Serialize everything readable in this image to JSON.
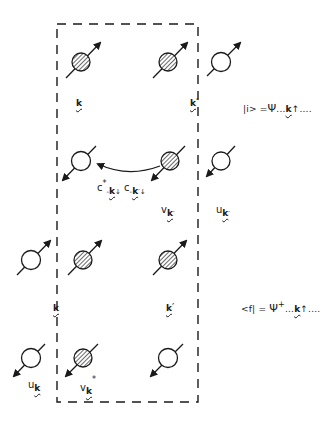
{
  "diagram": {
    "type": "pair-scattering-schematic",
    "box": {
      "style": "dashed",
      "x": 57,
      "y": 24,
      "width": 141,
      "height": 378,
      "stroke": "#1a1a1a"
    },
    "colors": {
      "ink": "#1a1a1a",
      "hatch": "#1a1a1a",
      "background": "#ffffff"
    },
    "rows": [
      {
        "name": "initial-up",
        "spins": [
          {
            "cx": 81,
            "cy": 62,
            "filled": true,
            "dir": "up"
          },
          {
            "cx": 168,
            "cy": 62,
            "filled": true,
            "dir": "up"
          },
          {
            "cx": 221,
            "cy": 62,
            "filled": false,
            "dir": "up"
          }
        ],
        "labels": [
          {
            "id": "k",
            "text": "k",
            "x": 76,
            "y": 104,
            "prime": false
          },
          {
            "id": "k-prime",
            "text": "k",
            "x": 190,
            "y": 104,
            "prime": true
          }
        ]
      },
      {
        "name": "initial-down",
        "spins": [
          {
            "cx": 81,
            "cy": 161,
            "filled": false,
            "dir": "down"
          },
          {
            "cx": 170,
            "cy": 161,
            "filled": true,
            "dir": "down"
          },
          {
            "cx": 221,
            "cy": 161,
            "filled": false,
            "dir": "down"
          }
        ]
      },
      {
        "name": "final-up",
        "spins": [
          {
            "cx": 31,
            "cy": 260,
            "filled": false,
            "dir": "up"
          },
          {
            "cx": 83,
            "cy": 260,
            "filled": true,
            "dir": "up"
          },
          {
            "cx": 168,
            "cy": 260,
            "filled": true,
            "dir": "up"
          }
        ]
      },
      {
        "name": "final-down",
        "spins": [
          {
            "cx": 31,
            "cy": 358,
            "filled": false,
            "dir": "down"
          },
          {
            "cx": 83,
            "cy": 358,
            "filled": true,
            "dir": "down"
          },
          {
            "cx": 168,
            "cy": 358,
            "filled": false,
            "dir": "down"
          }
        ]
      }
    ],
    "transfer_arrow": {
      "from": [
        164,
        166
      ],
      "to": [
        100,
        160
      ],
      "curved": true
    }
  },
  "labels": {
    "row1_k": "k",
    "row1_kprime": "k",
    "prime": "′",
    "initial_state": {
      "bra": "|i> =",
      "psi": "Ψ",
      "dots1": "...",
      "k": "k",
      "spin": "↑",
      "dots2": "...."
    },
    "operators": {
      "c1": "c",
      "c1_sup": "*",
      "c1_sub_minus": "-",
      "c1_sub_k": "k",
      "c1_spin": "↓",
      "c2": "c",
      "c2_sub_minus": "-",
      "c2_sub_k": "k",
      "c2_prime": "′",
      "c2_spin": "↓"
    },
    "v_kprime": {
      "v": "v",
      "k": "k",
      "prime": "′"
    },
    "u_kprime": {
      "u": "u",
      "k": "k",
      "prime": "′"
    },
    "row3_k": "k",
    "row3_kprime": "k",
    "final_state": {
      "bra": "<f| =",
      "psi": "Ψ",
      "psi_sup": "+",
      "dots1": "...",
      "k": "k",
      "spin": "↑",
      "dots2": "...."
    },
    "u_k": {
      "u": "u",
      "k": "k"
    },
    "v_k_star": {
      "v": "v",
      "k": "k",
      "sup": "*"
    }
  }
}
